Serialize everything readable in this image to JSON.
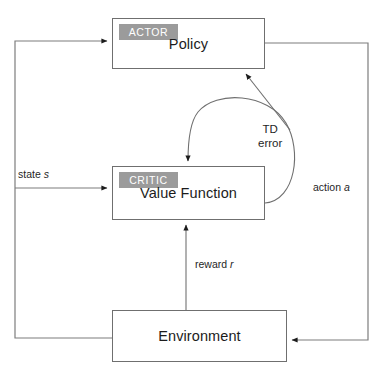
{
  "diagram": {
    "nodes": {
      "policy": {
        "label": "Policy",
        "role_tag": "ACTOR"
      },
      "value_function": {
        "label": "Value Function",
        "role_tag": "CRITIC"
      },
      "environment": {
        "label": "Environment"
      }
    },
    "edges": {
      "state": {
        "label_text": "state",
        "label_symbol": "s"
      },
      "action": {
        "label_text": "action",
        "label_symbol": "a"
      },
      "reward": {
        "label_text": "reward",
        "label_symbol": "r"
      },
      "td_error": {
        "line1": "TD",
        "line2": "error"
      }
    },
    "colors": {
      "background": "#ffffff",
      "box_border": "#6f6f6f",
      "wire": "#7d7d7d",
      "tag_background": "#9b9b9b",
      "tag_text": "#ffffff",
      "text": "#1c1c1c"
    }
  }
}
